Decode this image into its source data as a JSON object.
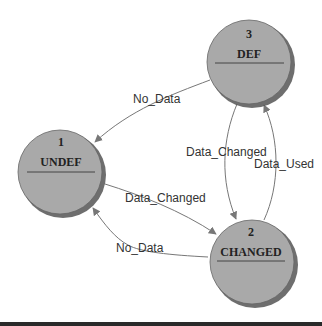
{
  "diagram": {
    "type": "state-machine",
    "colors": {
      "node_fill": "#a9a9a9",
      "node_shadow": "#555555",
      "edge": "#666666",
      "text": "#222222",
      "bottom_bar": "#2a2a2a"
    },
    "nodes": [
      {
        "id": "1",
        "number": "1",
        "name": "UNDEF"
      },
      {
        "id": "2",
        "number": "2",
        "name": "CHANGED"
      },
      {
        "id": "3",
        "number": "3",
        "name": "DEF"
      }
    ],
    "edges": [
      {
        "from": "3",
        "to": "1",
        "label": "No_Data"
      },
      {
        "from": "1",
        "to": "2",
        "label": "Data_Changed"
      },
      {
        "from": "2",
        "to": "1",
        "label": "No_Data"
      },
      {
        "from": "3",
        "to": "2",
        "label": "Data_Changed"
      },
      {
        "from": "2",
        "to": "3",
        "label": "Data_Used"
      }
    ]
  }
}
